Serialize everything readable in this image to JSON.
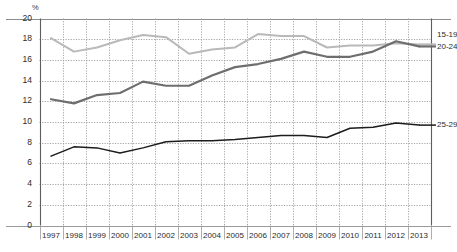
{
  "chart_data": {
    "type": "line",
    "title": "",
    "xlabel": "",
    "ylabel": "%",
    "unit_label": "%",
    "ylim": [
      0,
      20
    ],
    "ytick_step": 2,
    "yticks": [
      0,
      2,
      4,
      6,
      8,
      10,
      12,
      14,
      16,
      18,
      20
    ],
    "grid": true,
    "legend_position": "right-inline",
    "categories": [
      "1997",
      "1998",
      "1999",
      "2000",
      "2001",
      "2002",
      "2003",
      "2004",
      "2005",
      "2006",
      "2007",
      "2008",
      "2009",
      "2010",
      "2011",
      "2012",
      "2013"
    ],
    "series": [
      {
        "name": "15-19",
        "color": "#b9b9b9",
        "values": [
          18.1,
          16.8,
          17.2,
          17.9,
          18.4,
          18.2,
          16.6,
          17.0,
          17.2,
          18.5,
          18.3,
          18.3,
          17.2,
          17.4,
          17.4,
          17.6,
          17.5
        ]
      },
      {
        "name": "20-24",
        "color": "#6e6e6e",
        "values": [
          12.2,
          11.8,
          12.6,
          12.8,
          13.9,
          13.5,
          13.5,
          14.5,
          15.3,
          15.6,
          16.1,
          16.8,
          16.3,
          16.3,
          16.8,
          17.8,
          17.3
        ]
      },
      {
        "name": "25-29",
        "color": "#1c1c1c",
        "values": [
          6.7,
          7.6,
          7.5,
          7.0,
          7.5,
          8.1,
          8.2,
          8.2,
          8.3,
          8.5,
          8.7,
          8.7,
          8.5,
          9.4,
          9.5,
          9.9,
          9.7
        ]
      }
    ]
  },
  "axis": {
    "unit": "%",
    "y_labels": [
      "20",
      "18",
      "16",
      "14",
      "12",
      "10",
      "8",
      "6",
      "4",
      "2",
      "0"
    ],
    "x_labels": [
      "1997",
      "1998",
      "1999",
      "2000",
      "2001",
      "2002",
      "2003",
      "2004",
      "2005",
      "2006",
      "2007",
      "2008",
      "2009",
      "2010",
      "2011",
      "2012",
      "2013"
    ]
  },
  "legend": {
    "items": [
      {
        "label": "15-19"
      },
      {
        "label": "20-24"
      },
      {
        "label": "25-29"
      }
    ]
  },
  "faint_title": ""
}
